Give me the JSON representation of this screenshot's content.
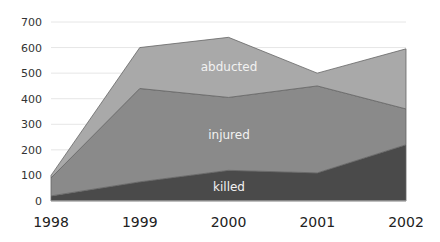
{
  "chart_data": {
    "type": "area",
    "stacked": true,
    "title": "",
    "xlabel": "",
    "ylabel": "",
    "categories": [
      "1998",
      "1999",
      "2000",
      "2001",
      "2002"
    ],
    "ylim": [
      0,
      700
    ],
    "yticks": [
      "0",
      "100",
      "200",
      "300",
      "400",
      "500",
      "600",
      "700"
    ],
    "grid": true,
    "legend": "inline labels",
    "series": [
      {
        "name": "killed",
        "values": [
          20,
          75,
          120,
          110,
          220
        ],
        "color": "#4a4a4a"
      },
      {
        "name": "injured",
        "values": [
          70,
          365,
          285,
          340,
          140
        ],
        "color": "#8a8a8a"
      },
      {
        "name": "abducted",
        "values": [
          10,
          160,
          235,
          50,
          235
        ],
        "color": "#a9a9a9"
      }
    ],
    "annotations": [
      "abducted",
      "injured",
      "killed"
    ]
  }
}
